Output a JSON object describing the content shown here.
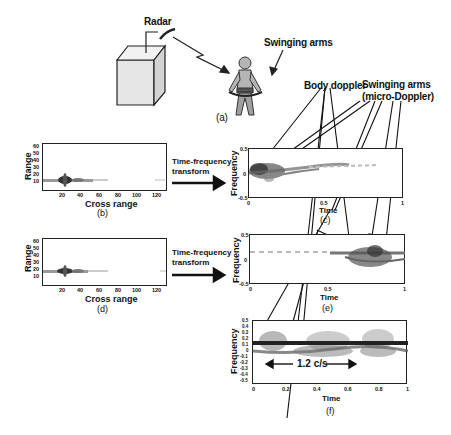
{
  "panel_a": {
    "radar_label": "Radar",
    "arms_label": "Swinging arms",
    "caption": "(a)"
  },
  "callouts": {
    "body_doppler": "Body doppler",
    "swinging_arms_line1": "Swinging arms",
    "swinging_arms_line2": "(micro-Doppler)"
  },
  "panel_b": {
    "caption": "(b)",
    "xlabel": "Cross range",
    "ylabel": "Range",
    "xticks": [
      "20",
      "40",
      "60",
      "80",
      "100",
      "120"
    ],
    "yticks": [
      "60",
      "50",
      "40",
      "30",
      "20",
      "10"
    ]
  },
  "panel_d": {
    "caption": "(d)",
    "xlabel": "Cross range",
    "ylabel": "Range",
    "xticks": [
      "20",
      "40",
      "60",
      "80",
      "100",
      "120"
    ],
    "yticks": [
      "60",
      "50",
      "40",
      "30",
      "20",
      "10"
    ]
  },
  "arrows": {
    "tf_line1": "Time-frequency",
    "tf_line2": "transform"
  },
  "panel_c": {
    "caption": "(c)",
    "xlabel": "Time",
    "ylabel": "Frequency",
    "xticks": [
      "0",
      "0.5",
      "1"
    ],
    "yticks": [
      "0.5",
      "0",
      "-0.5"
    ]
  },
  "panel_e": {
    "caption": "(e)",
    "xlabel": "Time",
    "ylabel": "Frequency",
    "xticks": [
      "0",
      "0.5",
      "1"
    ],
    "yticks": [
      "0.5",
      "0",
      "-0.5"
    ]
  },
  "panel_f": {
    "caption": "(f)",
    "xlabel": "Time",
    "ylabel": "Frequency",
    "xticks": [
      "0",
      "0.2",
      "0.4",
      "0.6",
      "0.8",
      "1"
    ],
    "yticks": [
      "0.5",
      "0.4",
      "0.3",
      "0.2",
      "0.1",
      "0",
      "-0.1",
      "-0.2",
      "-0.3",
      "-0.4",
      "-0.5"
    ],
    "annotation": "1.2 c/s"
  }
}
